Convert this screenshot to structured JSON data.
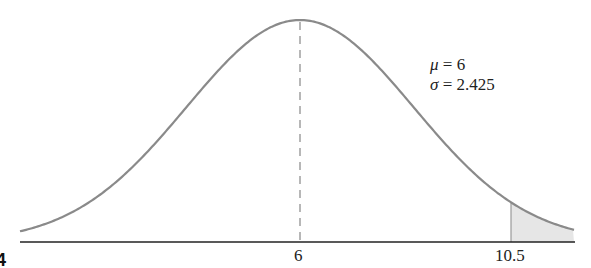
{
  "chart_data": {
    "type": "area",
    "title": "",
    "distribution": "normal",
    "mu": 6,
    "sigma": 2.425,
    "xlabel": "",
    "ylabel": "",
    "tick_labels": [
      "6",
      "10.5"
    ],
    "ticks": [
      6,
      10.5
    ],
    "shaded_region": {
      "from": 10.5,
      "to": "inf"
    },
    "mean_line": {
      "x": 6,
      "style": "dashed"
    },
    "annotations": [
      "μ = 6",
      "σ = 2.425"
    ],
    "grid": false,
    "legend": "none"
  },
  "labels": {
    "tick_mean": "6",
    "tick_cut": "10.5",
    "mu_symbol": "μ",
    "mu_value": " = 6",
    "sigma_symbol": "σ",
    "sigma_value": " = 2.425",
    "figure_fragment": "4"
  },
  "colors": {
    "curve": "#8a8a8a",
    "axis": "#222222",
    "shade": "#e6e6e6"
  }
}
